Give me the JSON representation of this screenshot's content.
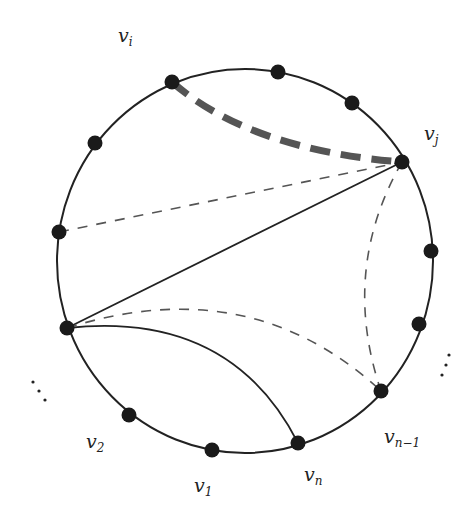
{
  "diagram": {
    "type": "circular-graph",
    "circle": {
      "cx": 245,
      "cy": 261,
      "rx": 188,
      "ry": 192,
      "stroke": "#222222"
    },
    "vertices": [
      {
        "id": "vi",
        "x": 172,
        "y": 82
      },
      {
        "id": "top1",
        "x": 278,
        "y": 72
      },
      {
        "id": "top2",
        "x": 352,
        "y": 103
      },
      {
        "id": "vj",
        "x": 402,
        "y": 162
      },
      {
        "id": "r1",
        "x": 431,
        "y": 251
      },
      {
        "id": "r2",
        "x": 419,
        "y": 324
      },
      {
        "id": "vn-1",
        "x": 381,
        "y": 391
      },
      {
        "id": "vn",
        "x": 298,
        "y": 443
      },
      {
        "id": "v1",
        "x": 212,
        "y": 450
      },
      {
        "id": "v2",
        "x": 129,
        "y": 415
      },
      {
        "id": "l1",
        "x": 67,
        "y": 328
      },
      {
        "id": "l2",
        "x": 59,
        "y": 232
      },
      {
        "id": "l3",
        "x": 95,
        "y": 143
      }
    ],
    "vertex_color": "#1a1a1a",
    "edges": [
      {
        "from": "vi",
        "to": "vj",
        "style": "thick-dashed",
        "color": "#555555",
        "path": "M172,82 Q250,150 402,162"
      },
      {
        "from": "l2",
        "to": "vj",
        "style": "dashed",
        "color": "#555555",
        "path": "M59,232 L402,162"
      },
      {
        "from": "l1",
        "to": "vj",
        "style": "solid",
        "color": "#222222",
        "path": "M67,328 L402,162"
      },
      {
        "from": "vj",
        "to": "vn-1",
        "style": "dashed",
        "color": "#555555",
        "path": "M402,162 Q340,270 381,391"
      },
      {
        "from": "l1",
        "to": "vn-1",
        "style": "dashed",
        "color": "#555555",
        "path": "M67,328 Q250,270 381,391"
      },
      {
        "from": "l1",
        "to": "vn",
        "style": "solid",
        "color": "#222222",
        "path": "M67,328 Q230,310 298,443"
      }
    ],
    "labels": [
      {
        "id": "label-vi",
        "base": "v",
        "sub": "i",
        "x": 118,
        "y": 26
      },
      {
        "id": "label-vj",
        "base": "v",
        "sub": "j",
        "x": 424,
        "y": 124
      },
      {
        "id": "label-vn-1",
        "base": "v",
        "sub": "n−1",
        "x": 384,
        "y": 427
      },
      {
        "id": "label-vn",
        "base": "v",
        "sub": "n",
        "x": 304,
        "y": 465
      },
      {
        "id": "label-v1",
        "base": "v",
        "sub": "1",
        "x": 194,
        "y": 476
      },
      {
        "id": "label-v2",
        "base": "v",
        "sub": "2",
        "x": 86,
        "y": 432
      }
    ],
    "ellipsis_dots": {
      "left": [
        [
          33,
          382
        ],
        [
          39,
          391
        ],
        [
          45,
          400
        ]
      ],
      "right": [
        [
          449,
          355
        ],
        [
          446,
          365
        ],
        [
          442,
          375
        ]
      ]
    }
  }
}
